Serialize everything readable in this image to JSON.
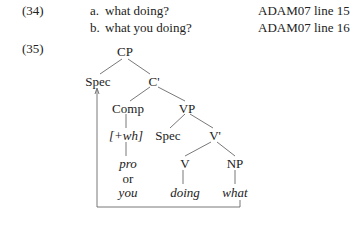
{
  "examples": [
    {
      "number": "(34)",
      "items": [
        {
          "label": "a.",
          "text": "what doing?",
          "source": "ADAM07 line 15"
        },
        {
          "label": "b.",
          "text": "what you doing?",
          "source": "ADAM07 line 16"
        }
      ]
    },
    {
      "number": "(35)",
      "tree": {
        "root": "CP",
        "spec_cp": "Spec",
        "c_bar": "C'",
        "comp": "Comp",
        "comp_feature": "[+wh]",
        "comp_subject_1": "pro",
        "comp_subject_or": "or",
        "comp_subject_2": "you",
        "vp": "VP",
        "spec_vp": "Spec",
        "v_bar": "V'",
        "v": "V",
        "np": "NP",
        "verb": "doing",
        "object": "what"
      }
    }
  ]
}
